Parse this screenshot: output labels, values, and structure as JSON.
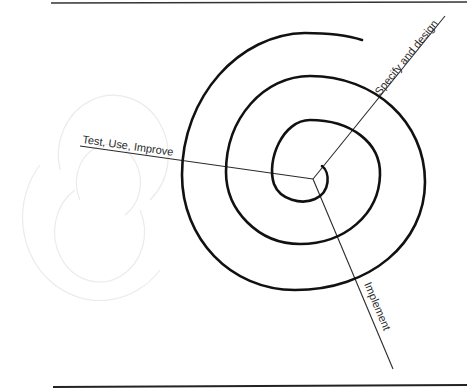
{
  "diagram": {
    "type": "spiral-model",
    "colors": {
      "spiral": "#111111",
      "axis": "#2a2a2a",
      "frame": "#333333",
      "ghost": "#e6e6e6",
      "background": "#ffffff"
    },
    "labels": {
      "specify": "Specify and design",
      "test": "Test, Use, Improve",
      "implement": "Implement"
    }
  }
}
